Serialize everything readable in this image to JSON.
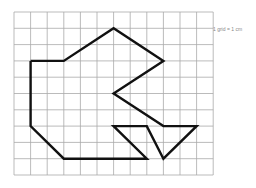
{
  "diagram": {
    "grid": {
      "cols": 12,
      "rows": 10,
      "origin_x": 14,
      "origin_y": 12,
      "cell_w": 16.6,
      "cell_h": 16.3,
      "line_color": "#aaaaaa"
    },
    "shape": {
      "stroke": "#111111",
      "stroke_width": 2.4,
      "vertices": [
        [
          1,
          3
        ],
        [
          3,
          3
        ],
        [
          6,
          1
        ],
        [
          9,
          3
        ],
        [
          6,
          5
        ],
        [
          9,
          7
        ],
        [
          11,
          7
        ],
        [
          9,
          9
        ],
        [
          8,
          7
        ],
        [
          6,
          7
        ],
        [
          8,
          9
        ],
        [
          3,
          9
        ],
        [
          1,
          7
        ],
        [
          1,
          3
        ]
      ]
    },
    "scale_label": "1 grid = 1 cm"
  }
}
